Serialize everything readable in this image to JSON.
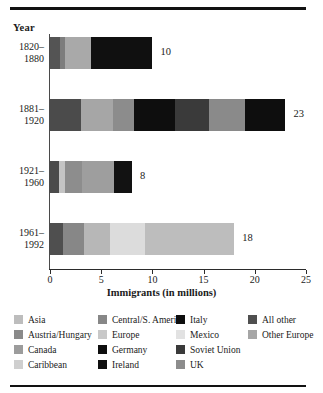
{
  "chart_data": {
    "type": "bar",
    "orientation": "horizontal",
    "stacked": true,
    "title": "",
    "xlabel": "Immigrants (in millions)",
    "ylabel": "Year",
    "xlim": [
      0,
      25
    ],
    "xticks": [
      0,
      5,
      10,
      15,
      20,
      25
    ],
    "grid": false,
    "legend_position": "below",
    "categories": [
      "1820–\n1880",
      "1881–\n1920",
      "1921–\n1960",
      "1961–\n1992"
    ],
    "totals": [
      10,
      23,
      8,
      18
    ],
    "total_labels": [
      "10",
      "23",
      "8",
      "18"
    ],
    "bars": [
      {
        "category": "1820–1880",
        "total": 10,
        "segments": [
          {
            "name": "All other",
            "value": 1.0,
            "color": "#545454"
          },
          {
            "name": "UK",
            "value": 0.5,
            "color": "#7d7d7d"
          },
          {
            "name": "Other Europe",
            "value": 2.5,
            "color": "#a9a9a9"
          },
          {
            "name": "Ireland",
            "value": 6.0,
            "color": "#101010"
          }
        ]
      },
      {
        "category": "1881–1920",
        "total": 23,
        "segments": [
          {
            "name": "All other",
            "value": 3.0,
            "color": "#4b4b4b"
          },
          {
            "name": "Other Europe",
            "value": 3.2,
            "color": "#a6a6a6"
          },
          {
            "name": "UK",
            "value": 2.0,
            "color": "#8c8c8c"
          },
          {
            "name": "Italy",
            "value": 4.0,
            "color": "#0e0e0e"
          },
          {
            "name": "Soviet Union",
            "value": 3.3,
            "color": "#3a3a3a"
          },
          {
            "name": "Austria/Hungary",
            "value": 3.5,
            "color": "#8a8a8a"
          },
          {
            "name": "Germany",
            "value": 4.0,
            "color": "#0e0e0e"
          }
        ]
      },
      {
        "category": "1921–1960",
        "total": 8,
        "segments": [
          {
            "name": "All other",
            "value": 0.9,
            "color": "#4b4b4b"
          },
          {
            "name": "Canada",
            "value": 0.6,
            "color": "#c4c4c4"
          },
          {
            "name": "Other Europe",
            "value": 1.6,
            "color": "#8d8d8d"
          },
          {
            "name": "Europe",
            "value": 3.2,
            "color": "#9e9e9e"
          },
          {
            "name": "Germany",
            "value": 1.7,
            "color": "#121212"
          }
        ]
      },
      {
        "category": "1961–1992",
        "total": 18,
        "segments": [
          {
            "name": "All other",
            "value": 1.3,
            "color": "#4f4f4f"
          },
          {
            "name": "Central/S. America",
            "value": 2.0,
            "color": "#878787"
          },
          {
            "name": "Caribbean",
            "value": 2.6,
            "color": "#b7b7b7"
          },
          {
            "name": "Mexico",
            "value": 3.4,
            "color": "#dcdcdc"
          },
          {
            "name": "Asia",
            "value": 8.7,
            "color": "#bdbdbd"
          }
        ]
      }
    ],
    "legend": [
      [
        {
          "label": "Asia",
          "color": "#bdbdbd"
        },
        {
          "label": "Austria/Hungary",
          "color": "#8a8a8a"
        },
        {
          "label": "Canada",
          "color": "#9c9c9c"
        },
        {
          "label": "Caribbean",
          "color": "#cfcfcf"
        }
      ],
      [
        {
          "label": "Central/S. America",
          "color": "#878787"
        },
        {
          "label": "Europe",
          "color": "#c8c8c8"
        },
        {
          "label": "Germany",
          "color": "#0e0e0e"
        },
        {
          "label": "Ireland",
          "color": "#101010"
        }
      ],
      [
        {
          "label": "Italy",
          "color": "#0e0e0e"
        },
        {
          "label": "Mexico",
          "color": "#e2e2e2"
        },
        {
          "label": "Soviet Union",
          "color": "#3a3a3a"
        },
        {
          "label": "UK",
          "color": "#8c8c8c"
        }
      ],
      [
        {
          "label": "All other",
          "color": "#4f4f4f"
        },
        {
          "label": "Other Europe",
          "color": "#a6a6a6"
        }
      ]
    ]
  },
  "axis": {
    "year_header": "Year",
    "xlabel": "Immigrants (in millions)",
    "ticks": [
      "0",
      "5",
      "10",
      "15",
      "20",
      "25"
    ]
  },
  "ylabels": [
    {
      "line1": "1820–",
      "line2": "1880"
    },
    {
      "line1": "1881–",
      "line2": "1920"
    },
    {
      "line1": "1921–",
      "line2": "1960"
    },
    {
      "line1": "1961–",
      "line2": "1992"
    }
  ]
}
